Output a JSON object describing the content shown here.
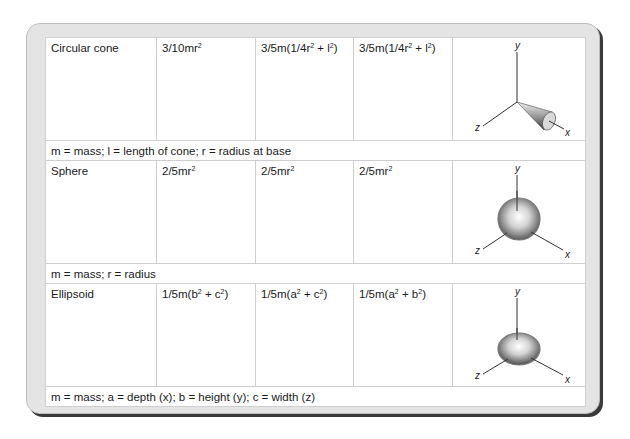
{
  "rows": [
    {
      "shape": "Circular cone",
      "ix": "3/10mr",
      "ix_sup": "2",
      "iy_pre": "3/5m(1/4r",
      "iy_sup1": "2",
      "iy_mid": " + l",
      "iy_sup2": "2",
      "iy_post": ")",
      "iz_pre": "3/5m(1/4r",
      "iz_sup1": "2",
      "iz_mid": " + l",
      "iz_sup2": "2",
      "iz_post": ")",
      "figure": "cone-on-axes-icon",
      "note": "m = mass; l = length of cone; r = radius at base"
    },
    {
      "shape": "Sphere",
      "ix": "2/5mr",
      "ix_sup": "2",
      "iy": "2/5mr",
      "iy_sup": "2",
      "iz": "2/5mr",
      "iz_sup": "2",
      "figure": "sphere-on-axes-icon",
      "note": "m = mass; r = radius"
    },
    {
      "shape": "Ellipsoid",
      "ix_pre": "1/5m(b",
      "ix_sup1": "2",
      "ix_mid": " + c",
      "ix_sup2": "2",
      "ix_post": ")",
      "iy_pre": "1/5m(a",
      "iy_sup1": "2",
      "iy_mid": " + c",
      "iy_sup2": "2",
      "iy_post": ")",
      "iz_pre": "1/5m(a",
      "iz_sup1": "2",
      "iz_mid": " + b",
      "iz_sup2": "2",
      "iz_post": ")",
      "figure": "ellipsoid-on-axes-icon",
      "note": "m = mass; a = depth (x); b = height (y); c = width (z)"
    }
  ],
  "axes": {
    "x": "x",
    "y": "y",
    "z": "z"
  },
  "colors": {
    "panel": "#e4e4e4",
    "shadow": "#3a3a3a",
    "grid": "#cfcfcf",
    "text": "#1a1a1a"
  }
}
